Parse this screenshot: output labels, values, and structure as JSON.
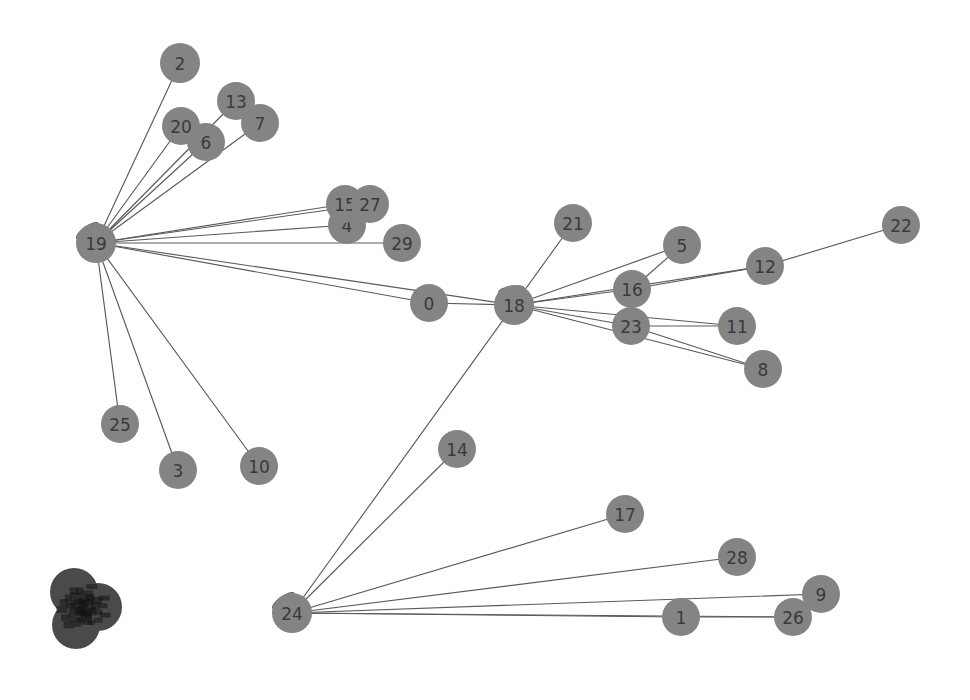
{
  "graph": {
    "title": "",
    "background_color": "#ffffff",
    "node_color": "#848484",
    "node_color_dark": "#4a4a4a",
    "edge_color": "#5a5a5a",
    "label_color": "#3a3a3a",
    "node_radius": 19,
    "nodes": [
      {
        "id": "n0",
        "label": "0",
        "x": 429,
        "y": 303,
        "r": 19,
        "dark": false
      },
      {
        "id": "n1",
        "label": "1",
        "x": 681,
        "y": 617,
        "r": 19,
        "dark": false
      },
      {
        "id": "n2",
        "label": "2",
        "x": 180,
        "y": 63,
        "r": 20,
        "dark": false
      },
      {
        "id": "n3",
        "label": "3",
        "x": 178,
        "y": 470,
        "r": 19,
        "dark": false
      },
      {
        "id": "n4",
        "label": "4",
        "x": 347,
        "y": 225,
        "r": 19,
        "dark": false
      },
      {
        "id": "n5",
        "label": "5",
        "x": 682,
        "y": 245,
        "r": 19,
        "dark": false
      },
      {
        "id": "n6",
        "label": "6",
        "x": 206,
        "y": 142,
        "r": 19,
        "dark": false
      },
      {
        "id": "n7",
        "label": "7",
        "x": 260,
        "y": 123,
        "r": 19,
        "dark": false
      },
      {
        "id": "n8",
        "label": "8",
        "x": 763,
        "y": 369,
        "r": 19,
        "dark": false
      },
      {
        "id": "n9",
        "label": "9",
        "x": 821,
        "y": 594,
        "r": 19,
        "dark": false
      },
      {
        "id": "n10",
        "label": "10",
        "x": 259,
        "y": 466,
        "r": 19,
        "dark": false
      },
      {
        "id": "n11",
        "label": "11",
        "x": 737,
        "y": 326,
        "r": 19,
        "dark": false
      },
      {
        "id": "n12",
        "label": "12",
        "x": 765,
        "y": 266,
        "r": 19,
        "dark": false
      },
      {
        "id": "n13",
        "label": "13",
        "x": 236,
        "y": 101,
        "r": 19,
        "dark": false
      },
      {
        "id": "n14",
        "label": "14",
        "x": 457,
        "y": 449,
        "r": 19,
        "dark": false
      },
      {
        "id": "n15",
        "label": "15",
        "x": 345,
        "y": 204,
        "r": 19,
        "dark": false
      },
      {
        "id": "n16",
        "label": "16",
        "x": 632,
        "y": 289,
        "r": 19,
        "dark": false
      },
      {
        "id": "n17",
        "label": "17",
        "x": 625,
        "y": 514,
        "r": 19,
        "dark": false
      },
      {
        "id": "n18",
        "label": "18",
        "x": 514,
        "y": 305,
        "r": 20,
        "dark": false
      },
      {
        "id": "n19",
        "label": "19",
        "x": 96,
        "y": 243,
        "r": 20,
        "dark": false
      },
      {
        "id": "n20",
        "label": "20",
        "x": 181,
        "y": 126,
        "r": 19,
        "dark": false
      },
      {
        "id": "n21",
        "label": "21",
        "x": 573,
        "y": 223,
        "r": 19,
        "dark": false
      },
      {
        "id": "n22",
        "label": "22",
        "x": 901,
        "y": 225,
        "r": 19,
        "dark": false
      },
      {
        "id": "n23",
        "label": "23",
        "x": 631,
        "y": 326,
        "r": 19,
        "dark": false
      },
      {
        "id": "n24",
        "label": "24",
        "x": 292,
        "y": 613,
        "r": 20,
        "dark": false
      },
      {
        "id": "n25",
        "label": "25",
        "x": 120,
        "y": 424,
        "r": 19,
        "dark": false
      },
      {
        "id": "n26",
        "label": "26",
        "x": 793,
        "y": 617,
        "r": 19,
        "dark": false
      },
      {
        "id": "n27",
        "label": "27",
        "x": 370,
        "y": 204,
        "r": 19,
        "dark": false
      },
      {
        "id": "n28",
        "label": "28",
        "x": 737,
        "y": 557,
        "r": 19,
        "dark": false
      },
      {
        "id": "n29",
        "label": "29",
        "x": 402,
        "y": 243,
        "r": 19,
        "dark": false
      },
      {
        "id": "c1",
        "label": "",
        "x": 74,
        "y": 592,
        "r": 24,
        "dark": true
      },
      {
        "id": "c2",
        "label": "",
        "x": 98,
        "y": 607,
        "r": 24,
        "dark": true
      },
      {
        "id": "c3",
        "label": "",
        "x": 76,
        "y": 625,
        "r": 24,
        "dark": true
      }
    ],
    "edges": [
      {
        "source": "n19",
        "target": "n2"
      },
      {
        "source": "n19",
        "target": "n20"
      },
      {
        "source": "n19",
        "target": "n6"
      },
      {
        "source": "n19",
        "target": "n13"
      },
      {
        "source": "n19",
        "target": "n7"
      },
      {
        "source": "n19",
        "target": "n15"
      },
      {
        "source": "n19",
        "target": "n27"
      },
      {
        "source": "n19",
        "target": "n4"
      },
      {
        "source": "n19",
        "target": "n29"
      },
      {
        "source": "n19",
        "target": "n0"
      },
      {
        "source": "n19",
        "target": "n18"
      },
      {
        "source": "n19",
        "target": "n25"
      },
      {
        "source": "n19",
        "target": "n3"
      },
      {
        "source": "n19",
        "target": "n10"
      },
      {
        "source": "n0",
        "target": "n18"
      },
      {
        "source": "n18",
        "target": "n21"
      },
      {
        "source": "n18",
        "target": "n16"
      },
      {
        "source": "n18",
        "target": "n5"
      },
      {
        "source": "n18",
        "target": "n12"
      },
      {
        "source": "n18",
        "target": "n23"
      },
      {
        "source": "n18",
        "target": "n11"
      },
      {
        "source": "n18",
        "target": "n8"
      },
      {
        "source": "n18",
        "target": "n24"
      },
      {
        "source": "n16",
        "target": "n5"
      },
      {
        "source": "n16",
        "target": "n12"
      },
      {
        "source": "n12",
        "target": "n22"
      },
      {
        "source": "n23",
        "target": "n11"
      },
      {
        "source": "n23",
        "target": "n8"
      },
      {
        "source": "n24",
        "target": "n14"
      },
      {
        "source": "n24",
        "target": "n17"
      },
      {
        "source": "n24",
        "target": "n28"
      },
      {
        "source": "n24",
        "target": "n1"
      },
      {
        "source": "n24",
        "target": "n26"
      },
      {
        "source": "n24",
        "target": "n9"
      },
      {
        "source": "n1",
        "target": "n26"
      }
    ],
    "self_loops": [
      {
        "node": "n19",
        "angle": 125,
        "size": 23
      },
      {
        "node": "n18",
        "angle": 100,
        "size": 23
      },
      {
        "node": "n24",
        "angle": 125,
        "size": 23
      }
    ]
  }
}
